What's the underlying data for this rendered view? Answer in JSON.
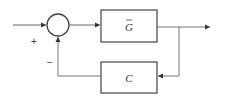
{
  "diagram": {
    "type": "feedback-control-block-diagram",
    "forward_block": {
      "label": "G",
      "overbar": true
    },
    "feedback_block": {
      "label": "C"
    },
    "summing_junction": {
      "input_sign": "+",
      "feedback_sign": "−"
    },
    "colors": {
      "stroke": "#555555",
      "background": "#ffffff",
      "text": "#333333"
    }
  }
}
